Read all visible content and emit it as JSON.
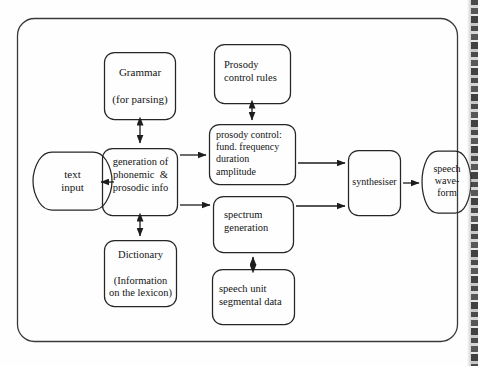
{
  "diagram": {
    "frame": {
      "name": "outer-frame"
    },
    "colors": {
      "stroke": "#222222",
      "background": "#fefefe",
      "text": "#141414"
    },
    "nodes": {
      "text_input": {
        "label": "text\ninput",
        "shape": "hexagon"
      },
      "grammar": {
        "label": "Grammar\n\n(for parsing)",
        "shape": "rounded-rect"
      },
      "generation": {
        "label": "generation of\nphonemic  &\nprosodic info",
        "shape": "rounded-rect"
      },
      "dictionary": {
        "label": "Dictionary\n\n(Information\non the lexicon)",
        "shape": "rounded-rect"
      },
      "prosody_rules": {
        "label": "Prosody\ncontrol rules",
        "shape": "rounded-rect"
      },
      "prosody_control": {
        "label": "prosody control:\nfund. frequency\nduration\namplitude",
        "shape": "rounded-rect"
      },
      "spectrum": {
        "label": "spectrum\ngeneration",
        "shape": "rounded-rect"
      },
      "speech_unit": {
        "label": "speech unit\nsegmental data",
        "shape": "rounded-rect"
      },
      "synthesiser": {
        "label": "synthesiser",
        "shape": "rounded-rect"
      },
      "speech_waveform": {
        "label": "speech\nwave-\nform",
        "shape": "hexagon"
      }
    },
    "edges": [
      {
        "name": "edge-text-input-to-generation",
        "from": "text_input",
        "to": "generation",
        "arrow": "single"
      },
      {
        "name": "edge-grammar-generation",
        "from": "grammar",
        "to": "generation",
        "arrow": "double"
      },
      {
        "name": "edge-dictionary-generation",
        "from": "dictionary",
        "to": "generation",
        "arrow": "double"
      },
      {
        "name": "edge-generation-to-prosody-control",
        "from": "generation",
        "to": "prosody_control",
        "arrow": "single"
      },
      {
        "name": "edge-generation-to-spectrum",
        "from": "generation",
        "to": "spectrum",
        "arrow": "single"
      },
      {
        "name": "edge-prosody-rules-prosody-control",
        "from": "prosody_rules",
        "to": "prosody_control",
        "arrow": "double"
      },
      {
        "name": "edge-speech-unit-spectrum",
        "from": "speech_unit",
        "to": "spectrum",
        "arrow": "double"
      },
      {
        "name": "edge-prosody-control-to-synthesiser",
        "from": "prosody_control",
        "to": "synthesiser",
        "arrow": "single"
      },
      {
        "name": "edge-spectrum-to-synthesiser",
        "from": "spectrum",
        "to": "synthesiser",
        "arrow": "single"
      },
      {
        "name": "edge-synthesiser-to-waveform",
        "from": "synthesiser",
        "to": "speech_waveform",
        "arrow": "single"
      }
    ]
  }
}
